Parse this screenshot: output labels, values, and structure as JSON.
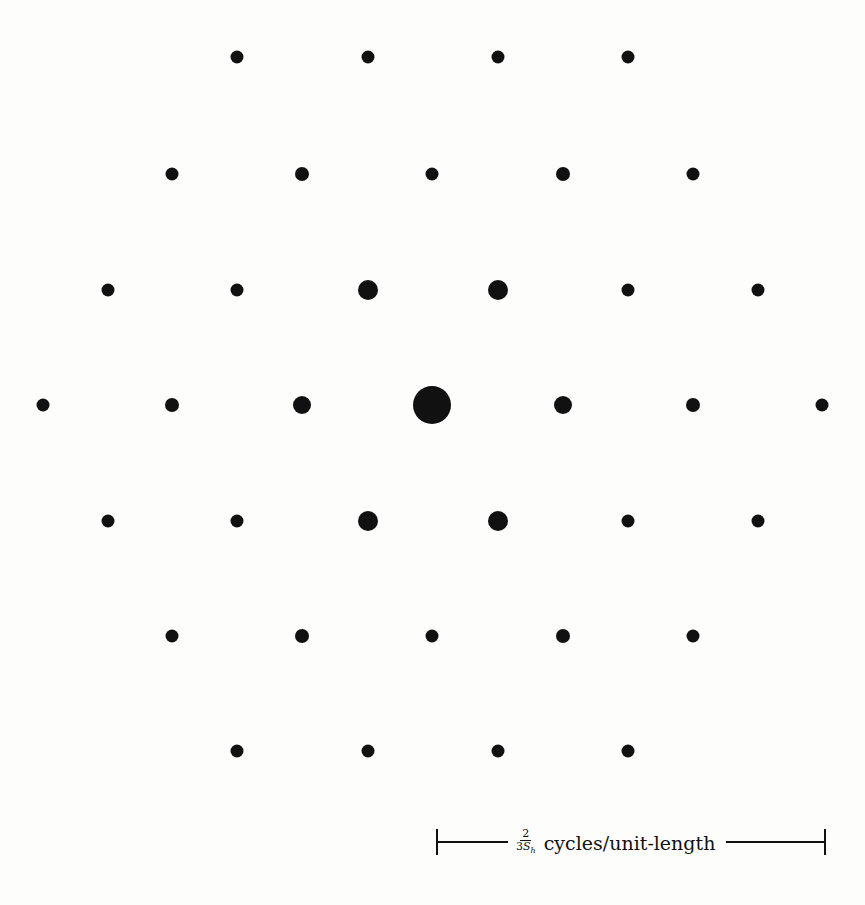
{
  "diagram": {
    "type": "hexagonal-lattice-spectrum",
    "background": "#fdfdfc",
    "dot_color": "#111111",
    "center": [
      432,
      405
    ],
    "spacing_x": 130,
    "spacing_y": 116,
    "dots": [
      {
        "x": 237,
        "y": 57,
        "d": 13
      },
      {
        "x": 368,
        "y": 57,
        "d": 13
      },
      {
        "x": 498,
        "y": 57,
        "d": 13
      },
      {
        "x": 628,
        "y": 57,
        "d": 13
      },
      {
        "x": 172,
        "y": 174,
        "d": 13
      },
      {
        "x": 302,
        "y": 174,
        "d": 14
      },
      {
        "x": 432,
        "y": 174,
        "d": 13
      },
      {
        "x": 563,
        "y": 174,
        "d": 14
      },
      {
        "x": 693,
        "y": 174,
        "d": 13
      },
      {
        "x": 108,
        "y": 290,
        "d": 13
      },
      {
        "x": 237,
        "y": 290,
        "d": 13
      },
      {
        "x": 368,
        "y": 290,
        "d": 20
      },
      {
        "x": 498,
        "y": 290,
        "d": 20
      },
      {
        "x": 628,
        "y": 290,
        "d": 13
      },
      {
        "x": 758,
        "y": 290,
        "d": 13
      },
      {
        "x": 43,
        "y": 405,
        "d": 13
      },
      {
        "x": 172,
        "y": 405,
        "d": 14
      },
      {
        "x": 302,
        "y": 405,
        "d": 18
      },
      {
        "x": 432,
        "y": 405,
        "d": 38
      },
      {
        "x": 563,
        "y": 405,
        "d": 18
      },
      {
        "x": 693,
        "y": 405,
        "d": 14
      },
      {
        "x": 822,
        "y": 405,
        "d": 13
      },
      {
        "x": 108,
        "y": 521,
        "d": 13
      },
      {
        "x": 237,
        "y": 521,
        "d": 13
      },
      {
        "x": 368,
        "y": 521,
        "d": 20
      },
      {
        "x": 498,
        "y": 521,
        "d": 20
      },
      {
        "x": 628,
        "y": 521,
        "d": 13
      },
      {
        "x": 758,
        "y": 521,
        "d": 13
      },
      {
        "x": 172,
        "y": 636,
        "d": 13
      },
      {
        "x": 302,
        "y": 636,
        "d": 14
      },
      {
        "x": 432,
        "y": 636,
        "d": 13
      },
      {
        "x": 563,
        "y": 636,
        "d": 14
      },
      {
        "x": 693,
        "y": 636,
        "d": 13
      },
      {
        "x": 237,
        "y": 751,
        "d": 13
      },
      {
        "x": 368,
        "y": 751,
        "d": 13
      },
      {
        "x": 498,
        "y": 751,
        "d": 13
      },
      {
        "x": 628,
        "y": 751,
        "d": 13
      }
    ]
  },
  "scale_bar": {
    "fraction_numerator": "2",
    "fraction_denominator_coeff": "3",
    "fraction_denominator_var": "S",
    "fraction_denominator_sub": "h",
    "unit_text": "cycles/unit-length"
  }
}
